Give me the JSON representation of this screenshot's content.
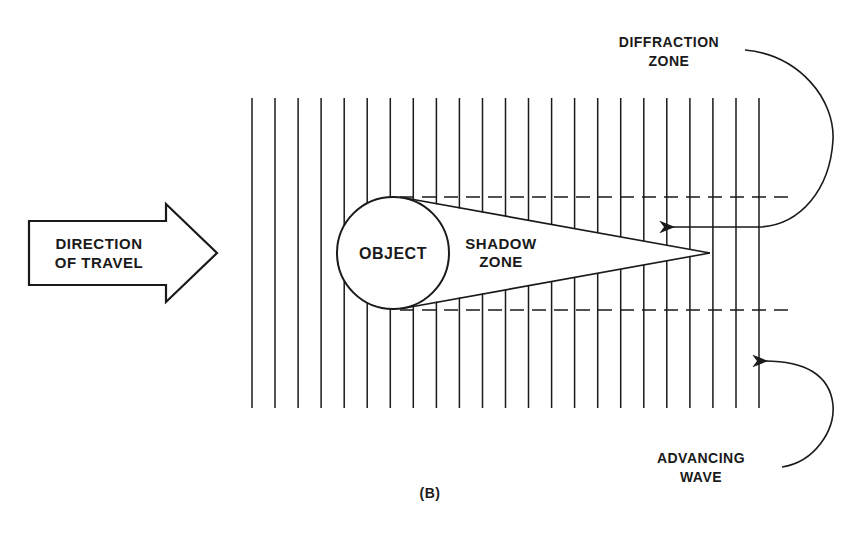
{
  "diagram": {
    "caption": "(B)",
    "direction_label": [
      "DIRECTION",
      "OF TRAVEL"
    ],
    "object_label": "OBJECT",
    "shadow_label": [
      "SHADOW",
      "ZONE"
    ],
    "diffraction_label": [
      "DIFFRACTION",
      "ZONE"
    ],
    "advancing_label": [
      "ADVANCING",
      "WAVE"
    ],
    "wavefront_count": 23,
    "colors": {
      "ink": "#1a1a1a",
      "background": "#ffffff"
    }
  }
}
